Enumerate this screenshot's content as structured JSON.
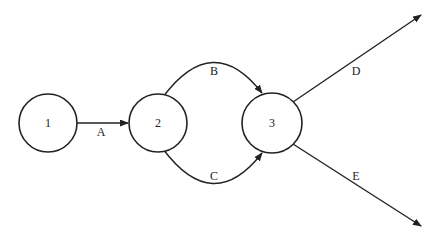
{
  "diagram": {
    "type": "network",
    "colors": {
      "stroke": "#222222",
      "background": "#ffffff"
    },
    "nodes": [
      {
        "id": "1",
        "label": "1"
      },
      {
        "id": "2",
        "label": "2"
      },
      {
        "id": "3",
        "label": "3"
      }
    ],
    "edges": [
      {
        "id": "A",
        "label": "A",
        "from": "1",
        "to": "2"
      },
      {
        "id": "B",
        "label": "B",
        "from": "2",
        "to": "3"
      },
      {
        "id": "C",
        "label": "C",
        "from": "2",
        "to": "3"
      },
      {
        "id": "D",
        "label": "D",
        "from": "3",
        "to": ""
      },
      {
        "id": "E",
        "label": "E",
        "from": "3",
        "to": ""
      }
    ]
  }
}
